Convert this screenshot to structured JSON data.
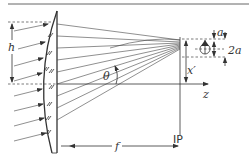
{
  "diagram": {
    "labels": {
      "h": "h",
      "theta": "θ",
      "f": "f",
      "z": "z",
      "x_prime": "x′",
      "a": "a",
      "two_a": "2a",
      "ip": "IP",
      "lens_marks": "∥"
    },
    "colors": {
      "line": "#333333",
      "background": "#ffffff"
    }
  }
}
